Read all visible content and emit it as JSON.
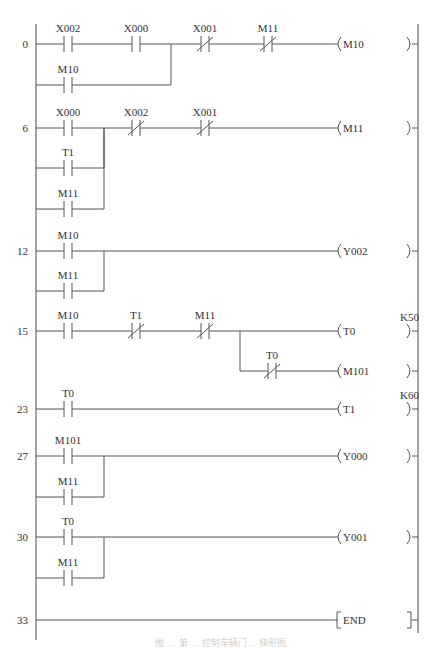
{
  "diagram": {
    "type": "ladder-logic",
    "left_rail_x": 36,
    "right_rail_x": 418,
    "rungs": [
      {
        "step": "0",
        "y": 44,
        "elements": [
          {
            "kind": "NO",
            "label": "X002",
            "x": 68,
            "y": 44
          },
          {
            "kind": "NO",
            "label": "X000",
            "x": 136,
            "y": 44
          },
          {
            "kind": "NC",
            "label": "X001",
            "x": 205,
            "y": 44
          },
          {
            "kind": "NC",
            "label": "M11",
            "x": 268,
            "y": 44
          },
          {
            "kind": "coil",
            "label": "M10",
            "x": 337,
            "y": 44
          }
        ],
        "branches": [
          {
            "kind": "NO",
            "label": "M10",
            "x": 68,
            "y": 85,
            "join_x": 171
          }
        ]
      },
      {
        "step": "6",
        "y": 128,
        "elements": [
          {
            "kind": "NO",
            "label": "X000",
            "x": 68,
            "y": 128
          },
          {
            "kind": "NC",
            "label": "X002",
            "x": 136,
            "y": 128
          },
          {
            "kind": "NC",
            "label": "X001",
            "x": 205,
            "y": 128
          },
          {
            "kind": "coil",
            "label": "M11",
            "x": 337,
            "y": 128
          }
        ],
        "branches": [
          {
            "kind": "NO",
            "label": "T1",
            "x": 68,
            "y": 168,
            "join_x": 104
          },
          {
            "kind": "NO",
            "label": "M11",
            "x": 68,
            "y": 209,
            "join_x": 104
          }
        ]
      },
      {
        "step": "12",
        "y": 251,
        "elements": [
          {
            "kind": "NO",
            "label": "M10",
            "x": 68,
            "y": 251
          },
          {
            "kind": "coil",
            "label": "Y002",
            "x": 337,
            "y": 251
          }
        ],
        "branches": [
          {
            "kind": "NO",
            "label": "M11",
            "x": 68,
            "y": 291,
            "join_x": 104
          }
        ]
      },
      {
        "step": "15",
        "y": 331,
        "elements": [
          {
            "kind": "NO",
            "label": "M10",
            "x": 68,
            "y": 331
          },
          {
            "kind": "NC",
            "label": "T1",
            "x": 136,
            "y": 331
          },
          {
            "kind": "NC",
            "label": "M11",
            "x": 205,
            "y": 331
          },
          {
            "kind": "coil",
            "label": "T0",
            "x": 337,
            "y": 331,
            "preset": "K50"
          }
        ],
        "sub_branch": {
          "split_x": 240,
          "y": 371,
          "contact": {
            "kind": "NC",
            "label": "T0",
            "x": 272,
            "y": 371
          },
          "coil": {
            "kind": "coil",
            "label": "M101",
            "x": 337,
            "y": 371
          }
        }
      },
      {
        "step": "23",
        "y": 409,
        "elements": [
          {
            "kind": "NO",
            "label": "T0",
            "x": 68,
            "y": 409
          },
          {
            "kind": "coil",
            "label": "T1",
            "x": 337,
            "y": 409,
            "preset": "K60"
          }
        ]
      },
      {
        "step": "27",
        "y": 456,
        "elements": [
          {
            "kind": "NO",
            "label": "M101",
            "x": 68,
            "y": 456
          },
          {
            "kind": "coil",
            "label": "Y000",
            "x": 337,
            "y": 456
          }
        ],
        "branches": [
          {
            "kind": "NO",
            "label": "M11",
            "x": 68,
            "y": 497,
            "join_x": 104
          }
        ]
      },
      {
        "step": "30",
        "y": 537,
        "elements": [
          {
            "kind": "NO",
            "label": "T0",
            "x": 68,
            "y": 537
          },
          {
            "kind": "coil",
            "label": "Y001",
            "x": 337,
            "y": 537
          }
        ],
        "branches": [
          {
            "kind": "NO",
            "label": "M11",
            "x": 68,
            "y": 578,
            "join_x": 104
          }
        ]
      },
      {
        "step": "33",
        "y": 620,
        "elements": [
          {
            "kind": "end",
            "label": "END",
            "x": 337,
            "y": 620
          }
        ]
      }
    ]
  },
  "caption": {
    "text": "图 … 第 … 控制车辆门… 梯形图"
  }
}
